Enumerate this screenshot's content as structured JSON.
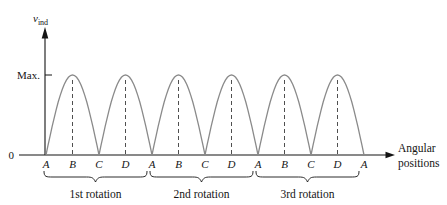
{
  "colors": {
    "background": "#ffffff",
    "axis": "#141414",
    "curve": "#8a8a8a",
    "dash_guide": "#4f4f4f",
    "text": "#141414"
  },
  "y_axis": {
    "label_main": "v",
    "label_sub": "ind",
    "max_label": "Max.",
    "origin_label": "0"
  },
  "x_axis": {
    "label_line1": "Angular",
    "label_line2": "positions"
  },
  "chart_data": {
    "type": "line",
    "title": "",
    "xlabel": "Angular positions",
    "ylabel": "v_ind",
    "grid": false,
    "x_tick_labels": [
      "A",
      "B",
      "C",
      "D",
      "A",
      "B",
      "C",
      "D",
      "A",
      "B",
      "C",
      "D",
      "A"
    ],
    "y_tick_labels": [
      "0",
      "Max."
    ],
    "ylim": [
      0,
      1
    ],
    "series": [
      {
        "name": "v_ind",
        "shape": "rectified-sine",
        "humps": 6,
        "peak_value_label": "Max.",
        "normalized_values_at_ticks": [
          0,
          1,
          0,
          1,
          0,
          1,
          0,
          1,
          0,
          1,
          0,
          1,
          0
        ],
        "peaks_at_positions": [
          "B",
          "D"
        ],
        "zeros_at_positions": [
          "A",
          "C"
        ]
      }
    ],
    "peak_guides": "vertical dashed line at every peak",
    "annotations": [
      {
        "text": "1st rotation",
        "tick_span": [
          0,
          4
        ]
      },
      {
        "text": "2nd rotation",
        "tick_span": [
          4,
          8
        ]
      },
      {
        "text": "3rd rotation",
        "tick_span": [
          8,
          12
        ]
      }
    ]
  }
}
